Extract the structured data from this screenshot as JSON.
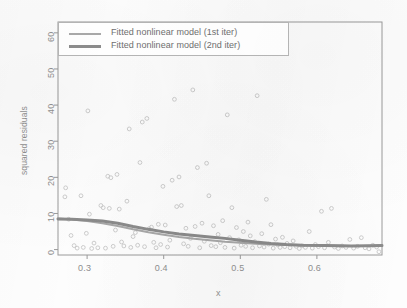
{
  "figure": {
    "background": "#fdfdfd",
    "frame_color": "#9a9a9a",
    "point_color": "#c9c9c9"
  },
  "axes": {
    "x_title": "x",
    "y_title": "squared residuals",
    "x_ticks": [
      "0.3",
      "0.4",
      "0.5",
      "0.6"
    ],
    "y_ticks": [
      "0",
      "10",
      "20",
      "30",
      "40",
      "50",
      "60"
    ]
  },
  "legend": {
    "items": [
      {
        "label": "Fitted nonlinear model (1st iter)",
        "color": "#a8a8a8",
        "width": 2
      },
      {
        "label": "Fitted nonlinear model (2nd iter)",
        "color": "#8b8b8b",
        "width": 3
      }
    ]
  },
  "chart_data": {
    "type": "scatter",
    "title": "",
    "xlabel": "x",
    "ylabel": "squared residuals",
    "xlim": [
      0.262,
      0.685
    ],
    "ylim": [
      -1.5,
      63
    ],
    "xticks": [
      0.3,
      0.4,
      0.5,
      0.6
    ],
    "yticks": [
      0,
      10,
      20,
      30,
      40,
      50,
      60
    ],
    "grid": false,
    "legend_position": "top-left",
    "series": [
      {
        "name": "squared residuals",
        "type": "scatter",
        "marker": "open-circle",
        "color": "#c9c9c9",
        "points": [
          [
            0.271,
            14.6
          ],
          [
            0.272,
            17.1
          ],
          [
            0.276,
            8.4
          ],
          [
            0.279,
            3.9
          ],
          [
            0.283,
            1.1
          ],
          [
            0.287,
            0.4
          ],
          [
            0.292,
            14.9
          ],
          [
            0.295,
            0.6
          ],
          [
            0.299,
            4.5
          ],
          [
            0.301,
            38.4
          ],
          [
            0.303,
            9.8
          ],
          [
            0.306,
            0.3
          ],
          [
            0.309,
            1.8
          ],
          [
            0.314,
            0.5
          ],
          [
            0.318,
            12.2
          ],
          [
            0.321,
            11.6
          ],
          [
            0.324,
            0.4
          ],
          [
            0.327,
            20.3
          ],
          [
            0.329,
            11.4
          ],
          [
            0.331,
            19.9
          ],
          [
            0.334,
            0.9
          ],
          [
            0.337,
            5.4
          ],
          [
            0.339,
            20.8
          ],
          [
            0.342,
            11.2
          ],
          [
            0.345,
            2.1
          ],
          [
            0.348,
            1.0
          ],
          [
            0.352,
            13.4
          ],
          [
            0.355,
            33.4
          ],
          [
            0.357,
            0.6
          ],
          [
            0.36,
            3.6
          ],
          [
            0.363,
            4.7
          ],
          [
            0.366,
            1.2
          ],
          [
            0.369,
            24.1
          ],
          [
            0.372,
            35.3
          ],
          [
            0.375,
            0.8
          ],
          [
            0.378,
            36.3
          ],
          [
            0.381,
            5.8
          ],
          [
            0.384,
            6.2
          ],
          [
            0.387,
            2.0
          ],
          [
            0.39,
            0.5
          ],
          [
            0.393,
            7.0
          ],
          [
            0.396,
            1.4
          ],
          [
            0.399,
            17.5
          ],
          [
            0.402,
            6.8
          ],
          [
            0.405,
            0.7
          ],
          [
            0.408,
            2.6
          ],
          [
            0.411,
            19.2
          ],
          [
            0.414,
            41.6
          ],
          [
            0.417,
            11.9
          ],
          [
            0.42,
            20.1
          ],
          [
            0.423,
            12.2
          ],
          [
            0.426,
            1.6
          ],
          [
            0.429,
            5.9
          ],
          [
            0.432,
            0.9
          ],
          [
            0.435,
            3.1
          ],
          [
            0.438,
            44.2
          ],
          [
            0.441,
            6.4
          ],
          [
            0.444,
            22.7
          ],
          [
            0.447,
            0.5
          ],
          [
            0.45,
            7.3
          ],
          [
            0.453,
            2.3
          ],
          [
            0.456,
            23.9
          ],
          [
            0.459,
            14.9
          ],
          [
            0.462,
            1.1
          ],
          [
            0.465,
            6.6
          ],
          [
            0.468,
            0.8
          ],
          [
            0.471,
            4.2
          ],
          [
            0.474,
            1.9
          ],
          [
            0.477,
            8.0
          ],
          [
            0.48,
            0.6
          ],
          [
            0.483,
            37.3
          ],
          [
            0.486,
            3.3
          ],
          [
            0.489,
            11.6
          ],
          [
            0.492,
            0.4
          ],
          [
            0.495,
            6.1
          ],
          [
            0.498,
            2.7
          ],
          [
            0.501,
            1.2
          ],
          [
            0.504,
            5.0
          ],
          [
            0.507,
            0.9
          ],
          [
            0.51,
            7.6
          ],
          [
            0.513,
            3.8
          ],
          [
            0.516,
            0.5
          ],
          [
            0.519,
            2.2
          ],
          [
            0.522,
            42.6
          ],
          [
            0.525,
            1.0
          ],
          [
            0.528,
            4.4
          ],
          [
            0.531,
            0.7
          ],
          [
            0.534,
            13.9
          ],
          [
            0.537,
            1.5
          ],
          [
            0.54,
            6.9
          ],
          [
            0.543,
            0.4
          ],
          [
            0.546,
            2.9
          ],
          [
            0.549,
            1.3
          ],
          [
            0.552,
            0.6
          ],
          [
            0.555,
            3.4
          ],
          [
            0.558,
            0.8
          ],
          [
            0.561,
            1.7
          ],
          [
            0.565,
            0.5
          ],
          [
            0.569,
            2.4
          ],
          [
            0.573,
            0.9
          ],
          [
            0.577,
            0.3
          ],
          [
            0.581,
            1.1
          ],
          [
            0.585,
            0.6
          ],
          [
            0.59,
            5.0
          ],
          [
            0.594,
            0.4
          ],
          [
            0.598,
            1.4
          ],
          [
            0.602,
            0.8
          ],
          [
            0.606,
            10.6
          ],
          [
            0.61,
            0.5
          ],
          [
            0.615,
            2.0
          ],
          [
            0.619,
            11.4
          ],
          [
            0.623,
            0.7
          ],
          [
            0.628,
            0.3
          ],
          [
            0.633,
            1.0
          ],
          [
            0.638,
            0.6
          ],
          [
            0.643,
            2.8
          ],
          [
            0.648,
            0.4
          ],
          [
            0.653,
            0.9
          ],
          [
            0.658,
            3.3
          ],
          [
            0.663,
            0.5
          ],
          [
            0.668,
            0.2
          ],
          [
            0.673,
            1.2
          ],
          [
            0.678,
            0.7
          ],
          [
            0.681,
            -0.6
          ]
        ]
      },
      {
        "name": "Fitted nonlinear model (1st iter)",
        "type": "line",
        "color": "#a8a8a8",
        "width": 2,
        "points": [
          [
            0.262,
            8.6
          ],
          [
            0.28,
            8.3
          ],
          [
            0.3,
            7.9
          ],
          [
            0.32,
            7.3
          ],
          [
            0.34,
            6.5
          ],
          [
            0.36,
            5.6
          ],
          [
            0.38,
            4.8
          ],
          [
            0.4,
            4.1
          ],
          [
            0.42,
            3.5
          ],
          [
            0.44,
            3.0
          ],
          [
            0.46,
            2.6
          ],
          [
            0.48,
            2.2
          ],
          [
            0.5,
            1.9
          ],
          [
            0.52,
            1.6
          ],
          [
            0.54,
            1.4
          ],
          [
            0.56,
            1.3
          ],
          [
            0.58,
            1.2
          ],
          [
            0.61,
            1.1
          ],
          [
            0.645,
            1.0
          ],
          [
            0.685,
            1.0
          ]
        ]
      },
      {
        "name": "Fitted nonlinear model (2nd iter)",
        "type": "line",
        "color": "#8b8b8b",
        "width": 3,
        "points": [
          [
            0.262,
            8.5
          ],
          [
            0.28,
            8.4
          ],
          [
            0.3,
            8.2
          ],
          [
            0.32,
            7.9
          ],
          [
            0.34,
            7.3
          ],
          [
            0.36,
            6.4
          ],
          [
            0.38,
            5.6
          ],
          [
            0.4,
            4.9
          ],
          [
            0.42,
            4.3
          ],
          [
            0.44,
            3.9
          ],
          [
            0.46,
            3.5
          ],
          [
            0.48,
            3.1
          ],
          [
            0.5,
            2.6
          ],
          [
            0.52,
            2.1
          ],
          [
            0.54,
            1.7
          ],
          [
            0.56,
            1.4
          ],
          [
            0.58,
            1.2
          ],
          [
            0.61,
            1.1
          ],
          [
            0.645,
            1.0
          ],
          [
            0.685,
            1.1
          ]
        ]
      }
    ]
  }
}
